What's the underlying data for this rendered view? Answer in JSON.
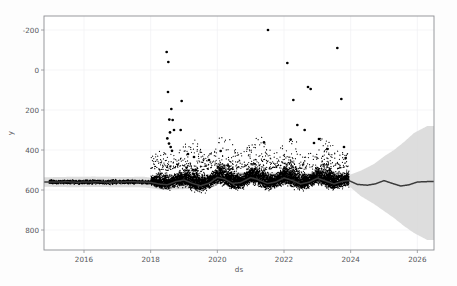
{
  "figure": {
    "background": "#fdfdfd",
    "plot_background": "#ffffff",
    "width": 457,
    "height": 286
  },
  "axes": {
    "x_label": "ds",
    "y_label": "y",
    "x_ticks": [
      "2016",
      "2018",
      "2020",
      "2022",
      "2024",
      "2026"
    ],
    "y_ticks": [
      "800",
      "600",
      "400",
      "200",
      "0",
      "-200"
    ]
  },
  "chart_data": {
    "type": "scatter",
    "title": "",
    "xlabel": "ds",
    "ylabel": "y",
    "xlim": [
      2014.8,
      2026.5
    ],
    "ylim": [
      -300,
      870
    ],
    "x_ticks": [
      2016,
      2018,
      2020,
      2022,
      2024,
      2026
    ],
    "y_ticks": [
      -200,
      0,
      200,
      400,
      600,
      800
    ],
    "grid": true,
    "legend": "none",
    "colors": {
      "observations": "#000000",
      "forecast_line": "#3b3b3b",
      "uncertainty_band": "#d7d7d7",
      "axis": "#8d8e92",
      "grid": "#f0f0f3",
      "text": "#55565b"
    },
    "series": [
      {
        "name": "observations (y)",
        "type": "scatter",
        "marker": "point",
        "color": "#000000",
        "x_range": [
          2014.95,
          2023.95
        ],
        "description": "Dense black scatter of daily observations; low-variance flat band near 40 from 2015 to 2018, then high-variance spread roughly 0-200 from 2018 to 2024 with seasonal humps and a long upper tail of outliers."
      },
      {
        "name": "yhat (forecast)",
        "type": "line",
        "color": "#3b3b3b",
        "x_range": [
          2014.95,
          2026.3
        ],
        "description": "Trend+seasonality line; ~40 flat 2015-2018, oscillating 20-70 with annual peaks 2018-2024, then forecast oscillating 15-50 to 2026."
      },
      {
        "name": "uncertainty interval",
        "type": "area",
        "color": "#d7d7d7",
        "x_range": [
          2014.95,
          2026.3
        ],
        "description": "Narrow band (+/-25) until 2024, then fans out to roughly +320 / -250 by 2026."
      }
    ],
    "trend_points": [
      {
        "x": 2014.95,
        "y": 40
      },
      {
        "x": 2015.2,
        "y": 40
      },
      {
        "x": 2015.5,
        "y": 41
      },
      {
        "x": 2015.8,
        "y": 39
      },
      {
        "x": 2016.1,
        "y": 40
      },
      {
        "x": 2016.4,
        "y": 41
      },
      {
        "x": 2016.7,
        "y": 39
      },
      {
        "x": 2017.0,
        "y": 40
      },
      {
        "x": 2017.4,
        "y": 41
      },
      {
        "x": 2017.8,
        "y": 40
      },
      {
        "x": 2018.0,
        "y": 38
      },
      {
        "x": 2018.25,
        "y": 30
      },
      {
        "x": 2018.5,
        "y": 26
      },
      {
        "x": 2018.75,
        "y": 42
      },
      {
        "x": 2019.0,
        "y": 50
      },
      {
        "x": 2019.25,
        "y": 33
      },
      {
        "x": 2019.5,
        "y": 21
      },
      {
        "x": 2019.75,
        "y": 34
      },
      {
        "x": 2020.0,
        "y": 63
      },
      {
        "x": 2020.2,
        "y": 56
      },
      {
        "x": 2020.45,
        "y": 33
      },
      {
        "x": 2020.7,
        "y": 37
      },
      {
        "x": 2021.0,
        "y": 62
      },
      {
        "x": 2021.2,
        "y": 53
      },
      {
        "x": 2021.5,
        "y": 32
      },
      {
        "x": 2021.75,
        "y": 40
      },
      {
        "x": 2022.0,
        "y": 61
      },
      {
        "x": 2022.25,
        "y": 48
      },
      {
        "x": 2022.5,
        "y": 30
      },
      {
        "x": 2022.75,
        "y": 39
      },
      {
        "x": 2023.0,
        "y": 59
      },
      {
        "x": 2023.25,
        "y": 45
      },
      {
        "x": 2023.5,
        "y": 30
      },
      {
        "x": 2023.75,
        "y": 43
      },
      {
        "x": 2023.95,
        "y": 47
      },
      {
        "x": 2024.2,
        "y": 28
      },
      {
        "x": 2024.5,
        "y": 24
      },
      {
        "x": 2024.75,
        "y": 31
      },
      {
        "x": 2025.0,
        "y": 47
      },
      {
        "x": 2025.25,
        "y": 33
      },
      {
        "x": 2025.5,
        "y": 20
      },
      {
        "x": 2025.75,
        "y": 26
      },
      {
        "x": 2026.0,
        "y": 40
      },
      {
        "x": 2026.3,
        "y": 42
      }
    ],
    "band_points": [
      {
        "x": 2014.95,
        "lo": 16,
        "hi": 64
      },
      {
        "x": 2015.6,
        "lo": 14,
        "hi": 66
      },
      {
        "x": 2016.3,
        "lo": 15,
        "hi": 67
      },
      {
        "x": 2017.0,
        "lo": 14,
        "hi": 65
      },
      {
        "x": 2017.8,
        "lo": 13,
        "hi": 66
      },
      {
        "x": 2018.4,
        "lo": 0,
        "hi": 55
      },
      {
        "x": 2019.2,
        "lo": 6,
        "hi": 60
      },
      {
        "x": 2020.0,
        "lo": 36,
        "hi": 90
      },
      {
        "x": 2021.0,
        "lo": 34,
        "hi": 88
      },
      {
        "x": 2022.0,
        "lo": 33,
        "hi": 87
      },
      {
        "x": 2023.0,
        "lo": 31,
        "hi": 86
      },
      {
        "x": 2023.95,
        "lo": 20,
        "hi": 74
      },
      {
        "x": 2024.3,
        "lo": -30,
        "hi": 96
      },
      {
        "x": 2024.7,
        "lo": -70,
        "hi": 130
      },
      {
        "x": 2025.0,
        "lo": -105,
        "hi": 168
      },
      {
        "x": 2025.3,
        "lo": -140,
        "hi": 200
      },
      {
        "x": 2025.6,
        "lo": -180,
        "hi": 240
      },
      {
        "x": 2025.9,
        "lo": -215,
        "hi": 285
      },
      {
        "x": 2026.3,
        "lo": -250,
        "hi": 320
      }
    ],
    "outliers": [
      {
        "x": 2018.48,
        "y": 690
      },
      {
        "x": 2018.53,
        "y": 640
      },
      {
        "x": 2018.52,
        "y": 490
      },
      {
        "x": 2018.62,
        "y": 405
      },
      {
        "x": 2018.66,
        "y": 350
      },
      {
        "x": 2018.56,
        "y": 352
      },
      {
        "x": 2018.7,
        "y": 300
      },
      {
        "x": 2018.58,
        "y": 288
      },
      {
        "x": 2018.5,
        "y": 258
      },
      {
        "x": 2018.55,
        "y": 232
      },
      {
        "x": 2018.6,
        "y": 215
      },
      {
        "x": 2018.64,
        "y": 196
      },
      {
        "x": 2018.93,
        "y": 445
      },
      {
        "x": 2018.9,
        "y": 300
      },
      {
        "x": 2019.12,
        "y": 180
      },
      {
        "x": 2019.3,
        "y": 165
      },
      {
        "x": 2019.75,
        "y": 150
      },
      {
        "x": 2020.1,
        "y": 195
      },
      {
        "x": 2021.52,
        "y": 800
      },
      {
        "x": 2022.1,
        "y": 635
      },
      {
        "x": 2023.6,
        "y": 710
      },
      {
        "x": 2022.72,
        "y": 515
      },
      {
        "x": 2022.8,
        "y": 505
      },
      {
        "x": 2022.28,
        "y": 450
      },
      {
        "x": 2023.72,
        "y": 455
      },
      {
        "x": 2022.4,
        "y": 325
      },
      {
        "x": 2022.62,
        "y": 300
      },
      {
        "x": 2022.2,
        "y": 252
      },
      {
        "x": 2023.05,
        "y": 255
      },
      {
        "x": 2022.9,
        "y": 235
      },
      {
        "x": 2023.8,
        "y": 215
      },
      {
        "x": 2021.4,
        "y": 238
      },
      {
        "x": 2023.3,
        "y": 205
      },
      {
        "x": 2023.85,
        "y": 160
      }
    ]
  }
}
